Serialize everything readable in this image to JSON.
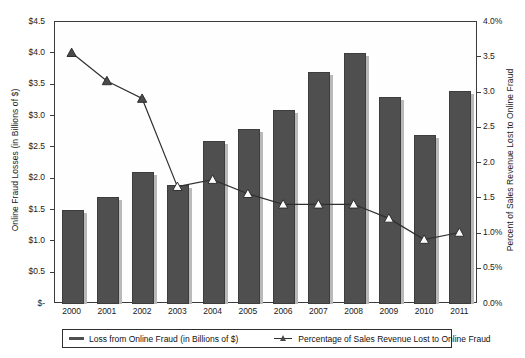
{
  "chart_data": {
    "type": "bar",
    "title": "",
    "categories": [
      "2000",
      "2001",
      "2002",
      "2003",
      "2004",
      "2005",
      "2006",
      "2007",
      "2008",
      "2009",
      "2010",
      "2011"
    ],
    "xlabel": "",
    "grid": false,
    "legend_position": "bottom",
    "series": [
      {
        "name": "Loss from Online Fraud (in Billions of $)",
        "type": "bar",
        "axis": "left",
        "values": [
          1.5,
          1.7,
          2.1,
          1.9,
          2.6,
          2.8,
          3.1,
          3.7,
          4.0,
          3.3,
          2.7,
          3.4
        ],
        "color": "#4f4f4f"
      },
      {
        "name": "Percentage of Sales Revenue Lost to Online Fraud",
        "type": "line",
        "axis": "right",
        "values": [
          3.55,
          3.15,
          2.9,
          1.65,
          1.75,
          1.55,
          1.4,
          1.4,
          1.4,
          1.2,
          0.9,
          1.0
        ],
        "color": "#2f2f2f",
        "marker": "triangle"
      }
    ],
    "left_axis": {
      "label": "Online Fraud Losses (in Billions of $)",
      "ylim": [
        0,
        4.5
      ],
      "ticks": [
        4.5,
        4.0,
        3.5,
        3.0,
        2.5,
        2.0,
        1.5,
        1.0,
        0.5,
        0
      ],
      "tick_labels": [
        "$4.5",
        "$4.0",
        "$3.5",
        "$3.0",
        "$2.5",
        "$2.0",
        "$1.5",
        "$1.0",
        "$0.5",
        "$-"
      ]
    },
    "right_axis": {
      "label": "Percent of Sales Revenue Lost to Online Fraud",
      "ylim": [
        0,
        4.0
      ],
      "ticks": [
        4.0,
        3.5,
        3.0,
        2.5,
        2.0,
        1.5,
        1.0,
        0.5,
        0
      ],
      "tick_labels": [
        "4.0%",
        "3.5",
        "3.0",
        "2.5",
        "2.0",
        "1.5",
        "1.0%",
        "0.5%",
        "0.0%"
      ]
    }
  },
  "legend": {
    "items": [
      {
        "label": "Loss from Online Fraud (in Billions of $)"
      },
      {
        "label": "Percentage of Sales Revenue Lost to Online Fraud"
      }
    ]
  }
}
